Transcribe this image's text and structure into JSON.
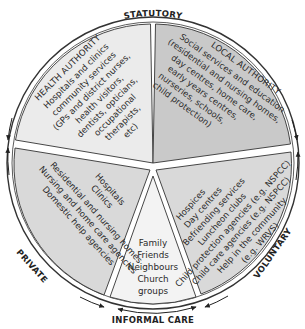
{
  "diagram": {
    "type": "segmented-circle",
    "outer_labels": {
      "top": "STATUTORY",
      "left": "PRIVATE",
      "right": "VOLUNTARY",
      "bottom": "INFORMAL CARE"
    },
    "segments": {
      "health": {
        "title": "HEALTH AUTHORITY",
        "lines": [
          "Hospitals and clinics",
          "community services",
          "(GPs and district nurses,",
          "health visitors,",
          "dentists, opticians,",
          "occupational",
          "therapists,",
          "etc)"
        ],
        "color": "#ebebeb"
      },
      "local": {
        "title": "LOCAL AUTHORITY",
        "lines": [
          "Social services and education",
          "(residential and nursing homes,",
          "day centres, home care,",
          "early years centres,",
          "nurseries, schools,",
          "child protection)"
        ],
        "color": "#c9c9c9"
      },
      "private": {
        "lines": [
          "Hospitals",
          "Clinics",
          "Residential and nursing homes",
          "Nursing and home care agencies",
          "Domestic help agencies"
        ],
        "color": "#d9d9d9"
      },
      "voluntary": {
        "lines": [
          "Hospices",
          "Day centres",
          "Befriending services",
          "Luncheon clubs",
          "Child protection agencies (e.g. NSPCC)",
          "Child care agencies (e.g. NSPCC)",
          "Help in the community",
          "(e.g. WRVS)"
        ],
        "color": "#d9d9d9"
      },
      "informal": {
        "lines": [
          "Family",
          "Friends",
          "Neighbours",
          "Church",
          "groups"
        ],
        "color": "#f3f3f3"
      }
    },
    "colors": {
      "outline": "#333333",
      "gap": "#ffffff"
    }
  }
}
